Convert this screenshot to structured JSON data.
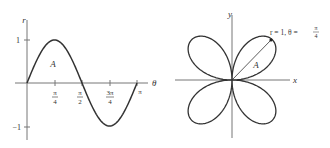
{
  "left_plot": {
    "type": "cartesian-graph",
    "function": "r = sin(2θ)",
    "y_axis_label": "r",
    "x_axis_label": "θ",
    "y_ticks": [
      {
        "value": 1,
        "label": "1"
      },
      {
        "value": -1,
        "label": "−1"
      }
    ],
    "x_ticks": [
      {
        "num": "π",
        "den": "4"
      },
      {
        "num": "π",
        "den": "2"
      },
      {
        "num": "3π",
        "den": "4"
      },
      {
        "label": "π"
      }
    ],
    "region_label": "A"
  },
  "right_plot": {
    "type": "polar-graph",
    "function": "four-leaved rose r = sin(2θ)",
    "x_axis_label": "x",
    "y_axis_label": "y",
    "region_label": "A",
    "annotation": {
      "text": "r = 1,  θ =",
      "frac_num": "π",
      "frac_den": "4"
    }
  },
  "colors": {
    "curve": "#333333",
    "axis": "#666666",
    "text": "#333333"
  }
}
